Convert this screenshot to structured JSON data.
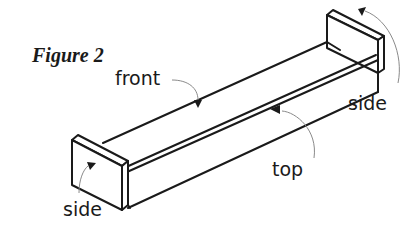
{
  "figure": {
    "caption": "Figure 2",
    "labels": {
      "front": "front",
      "top": "top",
      "side_right": "side",
      "side_left": "side"
    }
  }
}
